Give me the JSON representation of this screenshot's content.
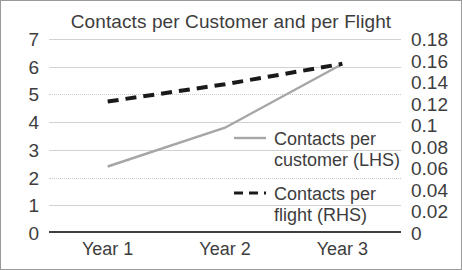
{
  "chart_data": {
    "type": "line",
    "title": "Contacts per Customer and per Flight",
    "xlabel": "",
    "ylabel": "",
    "categories": [
      "Year 1",
      "Year 2",
      "Year 3"
    ],
    "grid": true,
    "legend_position": "inside-right-center",
    "axes": {
      "left": {
        "ylim": [
          0,
          7
        ],
        "ticks": [
          0,
          1,
          2,
          3,
          4,
          5,
          6,
          7
        ],
        "tick_labels": [
          "0",
          "1",
          "2",
          "3",
          "4",
          "5",
          "6",
          "7"
        ]
      },
      "right": {
        "ylim": [
          0,
          0.18
        ],
        "ticks": [
          0,
          0.02,
          0.04,
          0.06,
          0.08,
          0.1,
          0.12,
          0.14,
          0.16,
          0.18
        ],
        "tick_labels": [
          "0",
          "0.02",
          "0.04",
          "0.06",
          "0.08",
          "0.1",
          "0.12",
          "0.14",
          "0.16",
          "0.18"
        ]
      }
    },
    "series": [
      {
        "name": "Contacts per customer (LHS)",
        "axis": "left",
        "style": "solid",
        "color": "#a6a6a6",
        "values": [
          2.4,
          3.8,
          6.1
        ]
      },
      {
        "name": "Contacts per flight (RHS)",
        "axis": "right",
        "style": "dashed",
        "color": "#1a1a1a",
        "values": [
          0.122,
          0.138,
          0.157
        ]
      }
    ]
  },
  "legend": {
    "items": [
      {
        "label_line1": "Contacts per",
        "label_line2": "customer (LHS)"
      },
      {
        "label_line1": "Contacts per",
        "label_line2": "flight (RHS)"
      }
    ]
  },
  "colors": {
    "frame_border": "#9a9a9a",
    "gridline": "#d2d2d2",
    "baseline": "#3f3f3f",
    "text": "#3d3d3d",
    "series_customer": "#a6a6a6",
    "series_flight": "#1a1a1a"
  }
}
